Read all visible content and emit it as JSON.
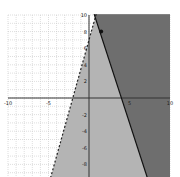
{
  "chart_data": {
    "type": "line",
    "title": "",
    "xlabel": "",
    "ylabel": "",
    "xlim": [
      -10,
      10
    ],
    "ylim": [
      -10,
      10
    ],
    "grid": true,
    "x_tick_labels": [
      "-10",
      "-5",
      "5",
      "10"
    ],
    "y_tick_labels": [
      "10",
      "8",
      "6",
      "4",
      "2",
      "-2",
      "-4",
      "-6",
      "-8"
    ],
    "series": [
      {
        "name": "dashed boundary",
        "style": "dashed",
        "slope": 3.5,
        "intercept": 7,
        "points": [
          [
            -4.8,
            -9.7
          ],
          [
            -2,
            0
          ],
          [
            -0.7,
            10
          ]
        ]
      },
      {
        "name": "solid boundary",
        "style": "solid",
        "slope": -3,
        "intercept": 12,
        "points": [
          [
            0.7,
            10
          ],
          [
            4,
            0
          ],
          [
            8.7,
            -10
          ]
        ]
      }
    ],
    "shaded_regions": [
      {
        "description": "right of dashed line",
        "color": "#b4b4b4"
      },
      {
        "description": "right of solid line (overlap)",
        "color": "#6e6e6e"
      }
    ],
    "points": [
      [
        1.5,
        8
      ]
    ]
  },
  "colors": {
    "light_shade": "#b4b4b4",
    "dark_shade": "#6e6e6e",
    "grid": "#c8c8c8",
    "axis": "#333333"
  }
}
